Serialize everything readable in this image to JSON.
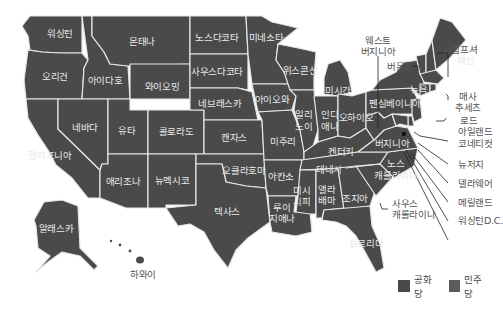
{
  "map": {
    "colors": {
      "republican": "#4a4a4a",
      "democrat": "#5c5c5c",
      "border": "#e6e6e6",
      "label_inside": "#e9e9e9",
      "label_outside": "#555555"
    },
    "states": [
      {
        "id": "WA",
        "label": "워싱턴",
        "party": "republican"
      },
      {
        "id": "OR",
        "label": "오리건",
        "party": "republican"
      },
      {
        "id": "CA",
        "label": "캘리포니아",
        "party": "republican"
      },
      {
        "id": "ID",
        "label": "아이다호",
        "party": "republican"
      },
      {
        "id": "NV",
        "label": "네바다",
        "party": "republican"
      },
      {
        "id": "MT",
        "label": "몬태나",
        "party": "republican"
      },
      {
        "id": "WY",
        "label": "와이오밍",
        "party": "republican"
      },
      {
        "id": "UT",
        "label": "유타",
        "party": "republican"
      },
      {
        "id": "AZ",
        "label": "애리조나",
        "party": "republican"
      },
      {
        "id": "CO",
        "label": "콜로라도",
        "party": "republican"
      },
      {
        "id": "NM",
        "label": "뉴멕시코",
        "party": "republican"
      },
      {
        "id": "ND",
        "label": "노스다코타",
        "party": "republican"
      },
      {
        "id": "SD",
        "label": "사우스다코타",
        "party": "republican"
      },
      {
        "id": "NE",
        "label": "네브래스카",
        "party": "republican"
      },
      {
        "id": "KS",
        "label": "캔자스",
        "party": "republican"
      },
      {
        "id": "OK",
        "label": "오클라호마",
        "party": "republican"
      },
      {
        "id": "TX",
        "label": "텍사스",
        "party": "republican"
      },
      {
        "id": "MN",
        "label": "미네소타",
        "party": "republican"
      },
      {
        "id": "IA",
        "label": "아이오와",
        "party": "republican"
      },
      {
        "id": "MO",
        "label": "미주리",
        "party": "republican"
      },
      {
        "id": "AR",
        "label": "아칸소",
        "party": "republican"
      },
      {
        "id": "LA",
        "label": "루이지애나",
        "party": "republican"
      },
      {
        "id": "WI",
        "label": "위스콘신",
        "party": "republican"
      },
      {
        "id": "IL",
        "label": "일리노이",
        "party": "republican"
      },
      {
        "id": "MI",
        "label": "미시간",
        "party": "republican"
      },
      {
        "id": "IN",
        "label": "인디애나",
        "party": "republican"
      },
      {
        "id": "OH",
        "label": "오하이오",
        "party": "republican"
      },
      {
        "id": "KY",
        "label": "켄터키",
        "party": "republican"
      },
      {
        "id": "TN",
        "label": "테네시",
        "party": "republican"
      },
      {
        "id": "MS",
        "label": "미시시피",
        "party": "republican"
      },
      {
        "id": "AL",
        "label": "앨라배마",
        "party": "republican"
      },
      {
        "id": "GA",
        "label": "조지아",
        "party": "republican"
      },
      {
        "id": "FL",
        "label": "플로리다",
        "party": "republican"
      },
      {
        "id": "SC",
        "label": "사우스 캐롤라이나",
        "party": "republican"
      },
      {
        "id": "NC",
        "label": "노스 캐롤라이나",
        "party": "republican"
      },
      {
        "id": "VA",
        "label": "버지니아",
        "party": "republican"
      },
      {
        "id": "WV",
        "label": "웨스트 버지니아",
        "party": "republican"
      },
      {
        "id": "PA",
        "label": "펜실베이니아",
        "party": "republican"
      },
      {
        "id": "NY",
        "label": "뉴욕",
        "party": "republican"
      },
      {
        "id": "VT",
        "label": "버몬트",
        "party": "republican"
      },
      {
        "id": "NH",
        "label": "뉴햄프셔",
        "party": "republican"
      },
      {
        "id": "ME",
        "label": "메인",
        "party": "republican"
      },
      {
        "id": "MA",
        "label": "매사 추세츠",
        "party": "republican"
      },
      {
        "id": "RI",
        "label": "로드 아일랜드",
        "party": "republican"
      },
      {
        "id": "CT",
        "label": "코네티컷",
        "party": "republican"
      },
      {
        "id": "NJ",
        "label": "뉴저지",
        "party": "republican"
      },
      {
        "id": "DE",
        "label": "델라웨어",
        "party": "republican"
      },
      {
        "id": "MD",
        "label": "메릴랜드",
        "party": "republican"
      },
      {
        "id": "DC",
        "label": "워싱턴D.C.",
        "party": "republican"
      },
      {
        "id": "AK",
        "label": "알래스카",
        "party": "republican"
      },
      {
        "id": "HI",
        "label": "하와이",
        "party": "republican"
      }
    ],
    "labels": {
      "WA": "워싱턴",
      "OR": "오리건",
      "CA": "캘리포니아",
      "ID": "아이다호",
      "NV": "네바다",
      "MT": "몬태나",
      "WY": "와이오밍",
      "UT": "유타",
      "AZ": "애리조나",
      "CO": "콜로라도",
      "NM": "뉴멕시코",
      "ND": "노스다코타",
      "SD": "사우스다코타",
      "NE": "네브래스카",
      "KS": "캔자스",
      "OK": "오클라호마",
      "TX": "텍사스",
      "MN": "미네소타",
      "IA": "아이오와",
      "MO": "미주리",
      "AR": "아칸소",
      "LA1": "루이",
      "LA2": "지애나",
      "WI": "위스콘신",
      "IL1": "일리",
      "IL2": "노이",
      "MI": "미시간",
      "IN1": "인디",
      "IN2": "애나",
      "OH": "오하이오",
      "KY": "켄터키",
      "TN": "테네시",
      "MS1": "미시",
      "MS2": "시피",
      "AL1": "앨라",
      "AL2": "배마",
      "GA": "조지아",
      "FL": "플로리다",
      "SC1": "사우스",
      "SC2": "캐롤라이나",
      "NC1": "노스",
      "NC2": "캐롤라이나",
      "VA": "버지니아",
      "WV1": "웨스트",
      "WV2": "버지니아",
      "PA": "펜실베이니아",
      "NY": "뉴욕",
      "VT": "버몬트",
      "NH": "뉴햄프셔",
      "ME": "메인",
      "MA1": "매사",
      "MA2": "추세츠",
      "RI1": "로드",
      "RI2": "아일랜드",
      "CT": "코네티컷",
      "NJ": "뉴저지",
      "DE": "델라웨어",
      "MD": "메릴랜드",
      "DC": "워싱턴D.C.",
      "AK": "알래스카",
      "HI": "하와이"
    }
  },
  "legend": {
    "items": [
      {
        "label": "공화당",
        "color": "#4a4a4a"
      },
      {
        "label": "민주당",
        "color": "#5c5c5c"
      }
    ]
  }
}
